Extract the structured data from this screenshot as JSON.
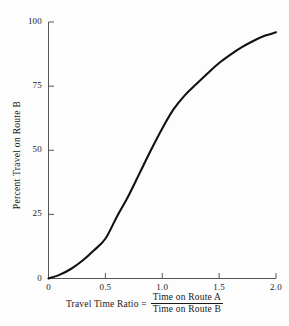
{
  "chart_data": {
    "type": "line",
    "title": "",
    "xlabel": "Travel Time Ratio = Time on Route A / Time on Route B",
    "ylabel": "Percent Travel on Route B",
    "xlim": [
      0,
      2.0
    ],
    "ylim": [
      0,
      100
    ],
    "grid": false,
    "legend": null,
    "xticks": [
      {
        "value": 0,
        "label": "0"
      },
      {
        "value": 0.5,
        "label": "0.5"
      },
      {
        "value": 1.0,
        "label": "1.0"
      },
      {
        "value": 1.5,
        "label": "1.5"
      },
      {
        "value": 2.0,
        "label": "2.0"
      }
    ],
    "yticks": [
      {
        "value": 0,
        "label": "0"
      },
      {
        "value": 25,
        "label": "25"
      },
      {
        "value": 50,
        "label": "50"
      },
      {
        "value": 75,
        "label": "75"
      },
      {
        "value": 100,
        "label": "100"
      }
    ],
    "series": [
      {
        "name": "Diversion curve",
        "color": "#111111",
        "x": [
          0.0,
          0.1,
          0.2,
          0.3,
          0.4,
          0.5,
          0.6,
          0.7,
          0.8,
          0.9,
          1.0,
          1.1,
          1.2,
          1.3,
          1.4,
          1.5,
          1.6,
          1.7,
          1.8,
          1.9,
          2.0
        ],
        "y": [
          0.0,
          1.5,
          3.8,
          7.0,
          11.0,
          15.5,
          24.0,
          32.0,
          41.0,
          50.0,
          58.5,
          66.0,
          71.5,
          75.8,
          80.0,
          84.0,
          87.3,
          90.2,
          92.6,
          94.6,
          96.0
        ]
      }
    ]
  },
  "axis": {
    "y_title": "Percent Travel on Route B",
    "x_caption_lead": "Travel Time Ratio =",
    "x_fraction_numerator": "Time on Route A",
    "x_fraction_denominator": "Time on Route B"
  },
  "colors": {
    "background": "#fdfdfd",
    "axis": "#555555",
    "curve": "#111111",
    "text": "#1a1a1a"
  }
}
